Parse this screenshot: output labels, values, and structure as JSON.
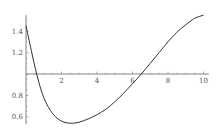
{
  "chart_data": {
    "type": "line",
    "title": "",
    "xlabel": "",
    "ylabel": "",
    "xlim": [
      0,
      10
    ],
    "ylim": [
      0.53,
      1.55
    ],
    "axis_origin": {
      "x": 0,
      "y": 1.0
    },
    "grid": false,
    "legend": null,
    "x_ticks": [
      2,
      4,
      6,
      8,
      10
    ],
    "x_tick_labels": [
      "2",
      "4",
      "6",
      "8",
      "10"
    ],
    "y_ticks": [
      0.6,
      0.8,
      1.2,
      1.4
    ],
    "y_tick_labels": [
      "0.6",
      "0.8",
      "1.2",
      "1.4"
    ],
    "series": [
      {
        "name": "f(x)",
        "color": "#333333",
        "x": [
          0,
          0.3,
          0.6,
          1.0,
          1.5,
          2.0,
          2.5,
          3.0,
          3.5,
          4.0,
          4.5,
          5.0,
          5.5,
          6.0,
          6.5,
          7.0,
          7.5,
          8.0,
          8.5,
          9.0,
          9.5,
          10.0
        ],
        "y": [
          1.45,
          1.22,
          1.0,
          0.78,
          0.63,
          0.56,
          0.54,
          0.55,
          0.58,
          0.62,
          0.67,
          0.74,
          0.82,
          0.91,
          1.0,
          1.1,
          1.2,
          1.3,
          1.39,
          1.46,
          1.52,
          1.55
        ]
      }
    ]
  }
}
